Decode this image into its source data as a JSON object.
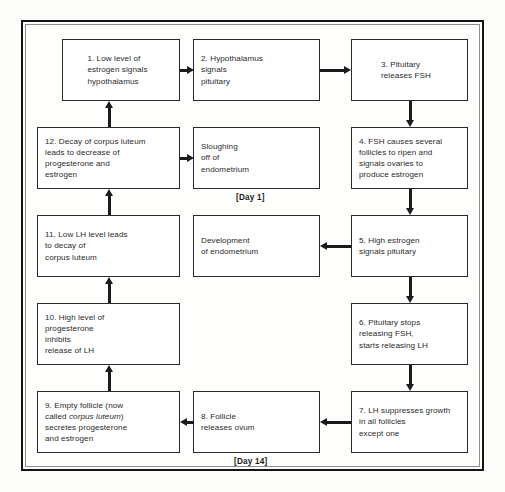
{
  "diagram": {
    "title_visible": false,
    "background_color": "#fdfdfb",
    "frame_color": "#141414",
    "box_border_color": "#2b2b2b",
    "arrow_color": "#1b1b1b",
    "nodes": [
      {
        "id": "step-1",
        "align": "center",
        "lines": [
          "1. Low level of",
          "estrogen signals",
          "hypothalamus"
        ],
        "x": 39,
        "y": 17,
        "w": 118,
        "h": 62
      },
      {
        "id": "step-2",
        "align": "left",
        "lines": [
          "2. Hypothalamus",
          "signals",
          "pituitary"
        ],
        "x": 170,
        "y": 17,
        "w": 127,
        "h": 62
      },
      {
        "id": "step-3",
        "align": "center",
        "lines": [
          "3. Pituitary",
          "releases FSH"
        ],
        "x": 328,
        "y": 17,
        "w": 117,
        "h": 62
      },
      {
        "id": "step-12",
        "align": "left",
        "lines": [
          "12. Decay of corpus luteum",
          "leads to decrease of",
          "progesterone and",
          "estrogen"
        ],
        "x": 14,
        "y": 105,
        "w": 143,
        "h": 62
      },
      {
        "id": "sloughing",
        "align": "left",
        "lines": [
          "Sloughing",
          "off of",
          "endometrium"
        ],
        "x": 170,
        "y": 105,
        "w": 127,
        "h": 62
      },
      {
        "id": "step-4",
        "align": "left",
        "lines": [
          "4. FSH causes several",
          "follicles to ripen and",
          "signals ovaries to",
          "produce estrogen"
        ],
        "x": 328,
        "y": 105,
        "w": 117,
        "h": 62
      },
      {
        "id": "step-11",
        "align": "left",
        "lines": [
          "11. Low LH level leads",
          "to decay of",
          "corpus luteum"
        ],
        "x": 14,
        "y": 193,
        "w": 143,
        "h": 62
      },
      {
        "id": "development",
        "align": "left",
        "lines": [
          "Development",
          "of endometrium"
        ],
        "x": 170,
        "y": 193,
        "w": 127,
        "h": 62
      },
      {
        "id": "step-5",
        "align": "left",
        "lines": [
          "5. High estrogen",
          "signals pituitary"
        ],
        "x": 328,
        "y": 193,
        "w": 117,
        "h": 62
      },
      {
        "id": "step-10",
        "align": "left",
        "lines": [
          "10. High level of",
          "progesterone",
          "inhibits",
          "release of LH"
        ],
        "x": 14,
        "y": 281,
        "w": 143,
        "h": 62
      },
      {
        "id": "step-6",
        "align": "left",
        "lines": [
          "6. Pituitary stops",
          "releasing FSH,",
          "starts releasing LH"
        ],
        "x": 328,
        "y": 281,
        "w": 117,
        "h": 62
      },
      {
        "id": "step-9",
        "align": "left",
        "lines": [
          "9. Empty follicle (now",
          "called corpus luteum)",
          "secretes progesterone",
          "and estrogen"
        ],
        "italic_lines": [
          1
        ],
        "italic_substring": "corpus luteum",
        "x": 14,
        "y": 369,
        "w": 143,
        "h": 62
      },
      {
        "id": "step-8",
        "align": "left",
        "lines": [
          "8. Follicle",
          "releases ovum"
        ],
        "x": 170,
        "y": 369,
        "w": 127,
        "h": 62
      },
      {
        "id": "step-7",
        "align": "left",
        "lines": [
          "7. LH suppresses growth",
          "in all follicles",
          "except one"
        ],
        "x": 328,
        "y": 369,
        "w": 117,
        "h": 62
      }
    ],
    "day_labels": [
      {
        "id": "day-1",
        "text": "[Day 1]",
        "x": 213,
        "y": 171
      },
      {
        "id": "day-14",
        "text": "[Day 14]",
        "x": 211,
        "y": 435
      }
    ],
    "arrows": [
      {
        "id": "arrow-1-to-2",
        "dir": "right",
        "from": "step-1",
        "to": "step-2",
        "x": 157,
        "y": 44,
        "len": 14
      },
      {
        "id": "arrow-2-to-3",
        "dir": "right",
        "from": "step-2",
        "to": "step-3",
        "x": 297,
        "y": 44,
        "len": 31
      },
      {
        "id": "arrow-3-to-4",
        "dir": "down",
        "from": "step-3",
        "to": "step-4",
        "x": 383,
        "y": 79,
        "len": 26
      },
      {
        "id": "arrow-12-to-sloughing",
        "dir": "right",
        "from": "step-12",
        "to": "sloughing",
        "x": 157,
        "y": 132,
        "len": 14
      },
      {
        "id": "arrow-4-to-5",
        "dir": "down",
        "from": "step-4",
        "to": "step-5",
        "x": 383,
        "y": 167,
        "len": 26
      },
      {
        "id": "arrow-12-to-1",
        "dir": "up",
        "from": "step-12",
        "to": "step-1",
        "x": 82,
        "y": 79,
        "len": 26
      },
      {
        "id": "arrow-11-to-12",
        "dir": "up",
        "from": "step-11",
        "to": "step-12",
        "x": 82,
        "y": 167,
        "len": 26
      },
      {
        "id": "arrow-5-to-development",
        "dir": "left",
        "from": "step-5",
        "to": "development",
        "x": 297,
        "y": 220,
        "len": 31
      },
      {
        "id": "arrow-5-to-6",
        "dir": "down",
        "from": "step-5",
        "to": "step-6",
        "x": 383,
        "y": 255,
        "len": 26
      },
      {
        "id": "arrow-10-to-11",
        "dir": "up",
        "from": "step-10",
        "to": "step-11",
        "x": 82,
        "y": 255,
        "len": 26
      },
      {
        "id": "arrow-6-to-7",
        "dir": "down",
        "from": "step-6",
        "to": "step-7",
        "x": 383,
        "y": 343,
        "len": 26
      },
      {
        "id": "arrow-9-to-10",
        "dir": "up",
        "from": "step-9",
        "to": "step-10",
        "x": 82,
        "y": 343,
        "len": 26
      },
      {
        "id": "arrow-7-to-8",
        "dir": "left",
        "from": "step-7",
        "to": "step-8",
        "x": 297,
        "y": 396,
        "len": 31
      },
      {
        "id": "arrow-8-to-9",
        "dir": "left",
        "from": "step-8",
        "to": "step-9",
        "x": 157,
        "y": 396,
        "len": 14
      }
    ]
  }
}
